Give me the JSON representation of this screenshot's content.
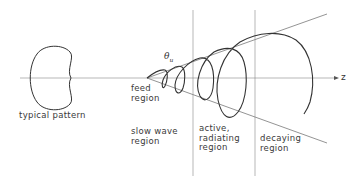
{
  "diagram": {
    "type": "conical helical antenna schematic with radiation pattern",
    "axis_label": "z",
    "cone_angle_label": "θ",
    "cone_angle_subscript": "u",
    "pattern_label": "typical pattern",
    "regions": [
      {
        "id": "feed",
        "label": "feed\nregion"
      },
      {
        "id": "slow-wave",
        "label": "slow wave\nregion"
      },
      {
        "id": "active",
        "label": "active,\nradiating\nregion"
      },
      {
        "id": "decaying",
        "label": "decaying\nregion"
      }
    ],
    "colors": {
      "line": "#333333",
      "axis": "#888888",
      "background": "#ffffff"
    }
  }
}
